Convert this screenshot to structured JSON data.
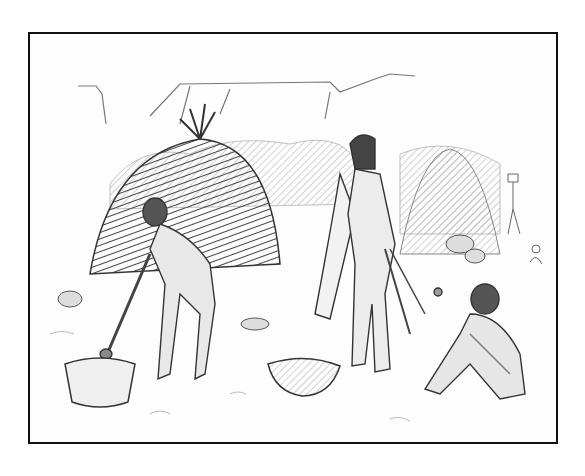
{
  "illustration": {
    "description": "Pencil sketch of indigenous people at a camp: a woman pounding with a pestle near a thatched dome hut, a standing man with cloak and spears, a seated person at right, smaller figures in the background, and a mesa cliff line on the horizon.",
    "style": "graphite pencil drawing, black rectangular border",
    "colors": {
      "border": "#111111",
      "paper": "#fdfdfd",
      "graphite_dark": "#333333",
      "graphite_mid": "#777777",
      "graphite_light": "#bbbbbb"
    },
    "elements": [
      "mesa-cliffs",
      "thatched-hut-left",
      "hut-right-background",
      "woman-with-pestle",
      "standing-man",
      "seated-person",
      "background-figures",
      "mortar-bowl-left",
      "basket-center",
      "rocks"
    ]
  }
}
